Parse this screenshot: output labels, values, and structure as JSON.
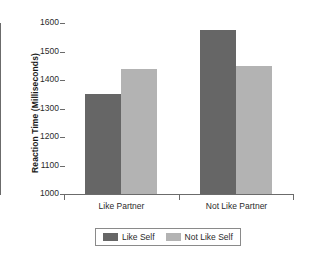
{
  "chart_data": {
    "type": "bar",
    "title": "",
    "subtitle": "",
    "xlabel": "",
    "ylabel": "Reaction Time (Milliseconds)",
    "categories": [
      "Like Partner",
      "Not Like Partner"
    ],
    "series": [
      {
        "name": "Like Self",
        "color": "#666666",
        "values": [
          1350,
          1575
        ]
      },
      {
        "name": "Not Like Self",
        "color": "#b3b3b3",
        "values": [
          1440,
          1450
        ]
      }
    ],
    "ylim": [
      1000,
      1600
    ],
    "ytick_step": 100,
    "ytick_labels": [
      "1600",
      "1500",
      "1400",
      "1300",
      "1200",
      "1100",
      "1000"
    ],
    "ytick_values": [
      1600,
      1500,
      1400,
      1300,
      1200,
      1100,
      1000
    ],
    "grid": false,
    "legend_position": "bottom",
    "legend_entries": [
      "Like Self",
      "Not Like Self"
    ]
  },
  "axes": {
    "y_title": "Reaction Time (Milliseconds)"
  },
  "legend": {
    "items": [
      {
        "label": "Like Self"
      },
      {
        "label": "Not Like Self"
      }
    ]
  }
}
